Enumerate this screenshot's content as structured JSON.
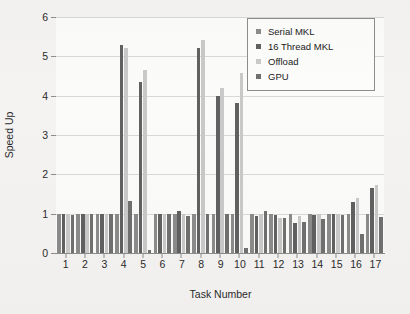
{
  "chart_data": {
    "type": "bar",
    "title": "",
    "xlabel": "Task Number",
    "ylabel": "Speed Up",
    "ylim": [
      0,
      6
    ],
    "yticks": [
      0,
      1,
      2,
      3,
      4,
      5,
      6
    ],
    "grid": true,
    "legend_position": "top-right",
    "categories": [
      "1",
      "2",
      "3",
      "4",
      "5",
      "6",
      "7",
      "8",
      "9",
      "10",
      "11",
      "12",
      "13",
      "14",
      "15",
      "16",
      "17"
    ],
    "series": [
      {
        "name": "Serial MKL",
        "color": "#8b8b8b",
        "values": [
          1.0,
          1.0,
          1.0,
          1.0,
          1.0,
          1.0,
          1.0,
          1.0,
          1.0,
          1.0,
          1.0,
          1.0,
          1.0,
          1.0,
          1.0,
          1.0,
          1.0
        ]
      },
      {
        "name": "16 Thread MKL",
        "color": "#616161",
        "values": [
          1.0,
          1.0,
          1.0,
          5.3,
          4.34,
          1.0,
          1.07,
          5.22,
          4.0,
          3.81,
          0.94,
          0.96,
          0.76,
          0.96,
          0.98,
          1.29,
          1.66
        ]
      },
      {
        "name": "Offload",
        "color": "#c9c9c9",
        "values": [
          1.0,
          1.0,
          1.0,
          5.22,
          4.65,
          1.0,
          1.0,
          5.41,
          4.19,
          4.57,
          1.0,
          0.9,
          0.95,
          1.0,
          1.0,
          1.41,
          1.74
        ]
      },
      {
        "name": "GPU",
        "color": "#707070",
        "values": [
          0.96,
          1.0,
          1.0,
          1.31,
          0.07,
          1.0,
          0.93,
          0.98,
          1.0,
          0.13,
          1.08,
          0.9,
          0.79,
          0.87,
          0.97,
          0.49,
          0.92
        ]
      }
    ]
  },
  "legend": {
    "items": [
      {
        "label": "Serial MKL"
      },
      {
        "label": "16 Thread MKL"
      },
      {
        "label": "Offload"
      },
      {
        "label": "GPU"
      }
    ]
  }
}
